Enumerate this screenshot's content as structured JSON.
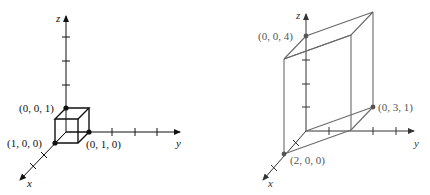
{
  "figures": [
    {
      "id": "unit-cube",
      "axes": {
        "x_label": "x",
        "y_label": "y",
        "z_label": "z"
      },
      "points": [
        {
          "label": "(0, 0, 1)"
        },
        {
          "label": "(1, 0, 0)"
        },
        {
          "label": "(0, 1, 0)"
        }
      ],
      "colors": {
        "stroke": "#111111"
      }
    },
    {
      "id": "parallelepiped",
      "axes": {
        "x_label": "x",
        "y_label": "y",
        "z_label": "z"
      },
      "points": [
        {
          "label": "(0, 0, 4)"
        },
        {
          "label": "(0, 3, 1)"
        },
        {
          "label": "(2, 0, 0)"
        }
      ],
      "colors": {
        "stroke": "#6a6a6a",
        "axis": "#333333"
      }
    }
  ]
}
